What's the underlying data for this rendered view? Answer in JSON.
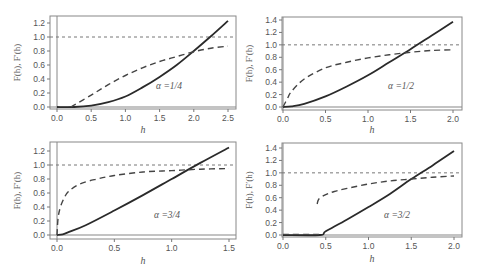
{
  "chart_data": [
    {
      "type": "line",
      "panel": "top-left",
      "annotation": "α =1/4",
      "xlabel": "h",
      "ylabel": "F(h), F′(h)",
      "xlim": [
        -0.08,
        2.6
      ],
      "ylim": [
        -0.02,
        1.28
      ],
      "xticks": [
        0.0,
        0.5,
        1.0,
        1.5,
        2.0,
        2.5
      ],
      "yticks": [
        0.0,
        0.2,
        0.4,
        0.6,
        0.8,
        1.0,
        1.2
      ],
      "grid": false,
      "reference_line": {
        "y": 1.0,
        "style": "dotted"
      },
      "series": [
        {
          "name": "F(h)",
          "style": "solid",
          "x": [
            0.0,
            0.25,
            0.5,
            0.75,
            1.0,
            1.25,
            1.5,
            1.75,
            2.0,
            2.25,
            2.5
          ],
          "y": [
            0.0,
            0.0,
            0.02,
            0.07,
            0.15,
            0.28,
            0.43,
            0.6,
            0.8,
            1.01,
            1.23
          ]
        },
        {
          "name": "F′(h)",
          "style": "dashed",
          "x": [
            0.2,
            0.5,
            0.75,
            1.0,
            1.25,
            1.5,
            1.75,
            2.0,
            2.25,
            2.5
          ],
          "y": [
            0.0,
            0.17,
            0.32,
            0.45,
            0.56,
            0.65,
            0.72,
            0.79,
            0.84,
            0.87
          ]
        }
      ]
    },
    {
      "type": "line",
      "panel": "top-right",
      "annotation": "α =1/2",
      "xlabel": "h",
      "ylabel": "F(h), F′(h)",
      "xlim": [
        -0.04,
        2.06
      ],
      "ylim": [
        -0.02,
        1.42
      ],
      "xticks": [
        0.0,
        0.5,
        1.0,
        1.5,
        2.0
      ],
      "yticks": [
        0.0,
        0.2,
        0.4,
        0.6,
        0.8,
        1.0,
        1.2,
        1.4
      ],
      "grid": false,
      "reference_line": {
        "y": 1.0,
        "style": "dotted"
      },
      "series": [
        {
          "name": "F(h)",
          "style": "solid",
          "x": [
            0.0,
            0.1,
            0.25,
            0.5,
            0.75,
            1.0,
            1.25,
            1.5,
            1.75,
            2.0
          ],
          "y": [
            0.0,
            0.01,
            0.05,
            0.17,
            0.33,
            0.51,
            0.72,
            0.93,
            1.15,
            1.37
          ]
        },
        {
          "name": "F′(h)",
          "style": "dashed",
          "x": [
            0.0,
            0.05,
            0.1,
            0.25,
            0.5,
            0.75,
            1.0,
            1.25,
            1.5,
            1.75,
            2.0
          ],
          "y": [
            0.0,
            0.13,
            0.25,
            0.45,
            0.63,
            0.72,
            0.79,
            0.84,
            0.88,
            0.91,
            0.92
          ]
        }
      ]
    },
    {
      "type": "line",
      "panel": "bottom-left",
      "annotation": "α =3/4",
      "xlabel": "h",
      "ylabel": "F(h), F′(h)",
      "xlim": [
        -0.04,
        1.56
      ],
      "ylim": [
        -0.03,
        1.29
      ],
      "xticks": [
        0.0,
        0.5,
        1.0,
        1.5
      ],
      "yticks": [
        0.0,
        0.2,
        0.4,
        0.6,
        0.8,
        1.0,
        1.2
      ],
      "grid": false,
      "reference_line": {
        "y": 1.0,
        "style": "dotted"
      },
      "series": [
        {
          "name": "F(h)",
          "style": "solid",
          "x": [
            0.0,
            0.05,
            0.1,
            0.25,
            0.5,
            0.75,
            1.0,
            1.25,
            1.5
          ],
          "y": [
            0.0,
            0.01,
            0.04,
            0.14,
            0.35,
            0.57,
            0.8,
            1.03,
            1.25
          ]
        },
        {
          "name": "F′(h)",
          "style": "dashed",
          "x": [
            0.0,
            0.01,
            0.03,
            0.06,
            0.1,
            0.2,
            0.35,
            0.5,
            0.75,
            1.0,
            1.25,
            1.5
          ],
          "y": [
            0.0,
            0.25,
            0.4,
            0.52,
            0.62,
            0.73,
            0.8,
            0.85,
            0.9,
            0.92,
            0.94,
            0.95
          ]
        }
      ]
    },
    {
      "type": "line",
      "panel": "bottom-right",
      "annotation": "α =3/2",
      "xlabel": "h",
      "ylabel": "F(h), F′(h)",
      "xlim": [
        -0.04,
        2.06
      ],
      "ylim": [
        -0.02,
        1.42
      ],
      "xticks": [
        0.0,
        0.5,
        1.0,
        1.5,
        2.0
      ],
      "yticks": [
        0.0,
        0.2,
        0.4,
        0.6,
        0.8,
        1.0,
        1.2,
        1.4
      ],
      "grid": false,
      "reference_line": {
        "y": 1.0,
        "style": "dotted"
      },
      "series": [
        {
          "name": "F(h)",
          "style": "solid",
          "x": [
            0.0,
            0.43,
            0.5,
            0.75,
            1.0,
            1.25,
            1.5,
            1.75,
            2.0
          ],
          "y": [
            0.0,
            0.0,
            0.06,
            0.25,
            0.45,
            0.66,
            0.9,
            1.12,
            1.35
          ]
        },
        {
          "name": "F′(h) (zero part)",
          "style": "dashed",
          "x": [
            0.0,
            0.42
          ],
          "y": [
            0.01,
            0.01
          ]
        },
        {
          "name": "F′(h)",
          "style": "dashed",
          "x": [
            0.4,
            0.42,
            0.5,
            0.6,
            0.75,
            1.0,
            1.25,
            1.5,
            1.75,
            2.0
          ],
          "y": [
            0.5,
            0.58,
            0.65,
            0.7,
            0.75,
            0.82,
            0.87,
            0.9,
            0.93,
            0.95
          ]
        }
      ]
    }
  ]
}
